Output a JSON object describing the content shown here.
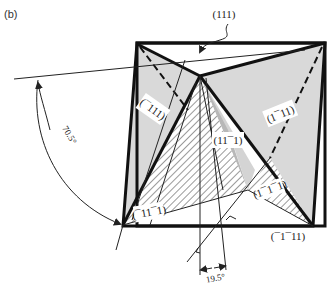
{
  "panel_label": "(b)",
  "faces": {
    "top": "(111)",
    "left": "(¯111)",
    "right": "(1¯11)",
    "center": "(11¯1)",
    "lower_left": "(¯11¯1)",
    "lower_right": "(1¯1¯1)",
    "bottom_right": "(¯1¯11)"
  },
  "angles": {
    "large": "70.5°",
    "small": "19.5°"
  },
  "colors": {
    "face_fill": "#d9d9d9",
    "center_fill": "#b8b8b8",
    "edge": "#111111",
    "hatch": "#555555"
  }
}
